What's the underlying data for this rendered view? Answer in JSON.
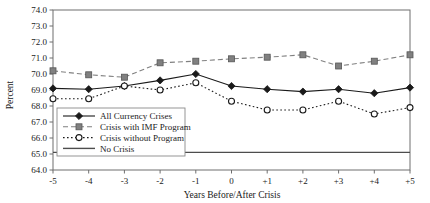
{
  "chart_data": {
    "type": "line",
    "title": "",
    "xlabel": "Years Before/After Crisis",
    "ylabel": "Percent",
    "x": [
      -5,
      -4,
      -3,
      -2,
      -1,
      0,
      1,
      2,
      3,
      4,
      5
    ],
    "xticklabels": [
      "-5",
      "-4",
      "-3",
      "-2",
      "-1",
      "0",
      "+1",
      "+2",
      "+3",
      "+4",
      "+5"
    ],
    "ylim": [
      64.0,
      74.0
    ],
    "yticks": [
      64.0,
      65.0,
      66.0,
      67.0,
      68.0,
      69.0,
      70.0,
      71.0,
      72.0,
      73.0,
      74.0
    ],
    "yticklabels": [
      "64.0",
      "65.0",
      "66.0",
      "67.0",
      "68.0",
      "69.0",
      "70.0",
      "71.0",
      "72.0",
      "73.0",
      "74.0"
    ],
    "grid": false,
    "legend_position": "lower-left-inside",
    "series": [
      {
        "name": "All Currency Crises",
        "marker": "filled-diamond",
        "linestyle": "solid",
        "color": "#1a1a1a",
        "values": [
          69.1,
          69.05,
          69.25,
          69.6,
          70.0,
          69.25,
          69.05,
          68.9,
          69.05,
          68.8,
          69.15
        ]
      },
      {
        "name": "Crisis with IMF Program",
        "marker": "filled-square",
        "linestyle": "dashed",
        "color": "#808080",
        "values": [
          70.2,
          69.95,
          69.8,
          70.7,
          70.8,
          70.95,
          71.05,
          71.2,
          70.5,
          70.8,
          71.2
        ]
      },
      {
        "name": "Crisis without Program",
        "marker": "open-circle",
        "linestyle": "dotted",
        "color": "#1a1a1a",
        "values": [
          68.45,
          68.45,
          69.25,
          69.0,
          69.45,
          68.3,
          67.75,
          67.75,
          68.3,
          67.5,
          67.9
        ]
      },
      {
        "name": "No Crisis",
        "marker": "none",
        "linestyle": "solid",
        "color": "#4d4d4d",
        "constant": 65.1,
        "values": [
          65.1,
          65.1,
          65.1,
          65.1,
          65.1,
          65.1,
          65.1,
          65.1,
          65.1,
          65.1,
          65.1
        ]
      }
    ],
    "legend_entries": [
      "All Currency Crises",
      "Crisis with IMF Program",
      "Crisis without Program",
      "No Crisis"
    ]
  }
}
